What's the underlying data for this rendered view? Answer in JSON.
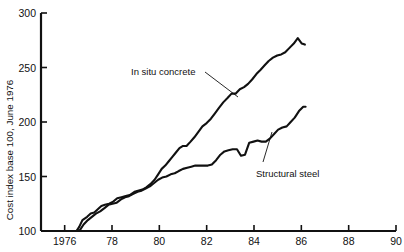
{
  "chart_data": {
    "type": "line",
    "title": "",
    "xlabel": "",
    "ylabel": "Cost index base 100, June 1976",
    "xlim": [
      1975.0,
      1990.0
    ],
    "ylim": [
      100,
      300
    ],
    "grid": false,
    "legend_position": "inline-annotations",
    "x_ticks": [
      1976,
      1978,
      1980,
      1982,
      1984,
      1986,
      1988,
      1990
    ],
    "x_tick_labels": [
      "1976",
      "78",
      "80",
      "82",
      "84",
      "86",
      "88",
      "90"
    ],
    "y_ticks": [
      100,
      150,
      200,
      250,
      300
    ],
    "y_tick_labels": [
      "100",
      "150",
      "200",
      "250",
      "300"
    ],
    "annotations": [
      {
        "text": "In situ concrete",
        "series": "In situ concrete"
      },
      {
        "text": "Structural steel",
        "series": "Structural steel"
      }
    ],
    "series": [
      {
        "name": "In situ concrete",
        "color": "#111111",
        "x": [
          1976.5,
          1976.62,
          1976.75,
          1976.95,
          1977.1,
          1977.25,
          1977.4,
          1977.55,
          1977.7,
          1977.88,
          1978.05,
          1978.22,
          1978.4,
          1978.58,
          1978.75,
          1978.95,
          1979.1,
          1979.28,
          1979.45,
          1979.62,
          1979.8,
          1979.95,
          1980.1,
          1980.25,
          1980.4,
          1980.55,
          1980.7,
          1980.85,
          1981.0,
          1981.15,
          1981.32,
          1981.48,
          1981.65,
          1981.82,
          1982.0,
          1982.18,
          1982.35,
          1982.52,
          1982.7,
          1982.88,
          1983.05,
          1983.22,
          1983.4,
          1983.58,
          1983.75,
          1983.92,
          1984.1,
          1984.28,
          1984.45,
          1984.62,
          1984.8,
          1984.98,
          1985.15,
          1985.32,
          1985.5,
          1985.68,
          1985.85,
          1986.02,
          1986.15
        ],
        "y": [
          100,
          104,
          110,
          113,
          116,
          117,
          120,
          123,
          124,
          125,
          127,
          130,
          131,
          132,
          133,
          136,
          137,
          138,
          140,
          143,
          147,
          152,
          157,
          160,
          164,
          168,
          172,
          176,
          178,
          178,
          182,
          186,
          191,
          196,
          199,
          203,
          208,
          213,
          218,
          222,
          226,
          226,
          230,
          232,
          235,
          239,
          244,
          248,
          252,
          256,
          259,
          261,
          262,
          264,
          268,
          272,
          277,
          272,
          271
        ]
      },
      {
        "name": "Structural steel",
        "color": "#111111",
        "x": [
          1976.5,
          1976.65,
          1976.8,
          1976.98,
          1977.15,
          1977.32,
          1977.5,
          1977.68,
          1977.85,
          1978.02,
          1978.2,
          1978.38,
          1978.55,
          1978.72,
          1978.9,
          1979.08,
          1979.25,
          1979.42,
          1979.6,
          1979.78,
          1979.95,
          1980.12,
          1980.3,
          1980.48,
          1980.65,
          1980.82,
          1981.0,
          1981.18,
          1981.35,
          1981.52,
          1981.7,
          1981.88,
          1982.05,
          1982.22,
          1982.4,
          1982.58,
          1982.75,
          1982.92,
          1983.1,
          1983.28,
          1983.45,
          1983.62,
          1983.8,
          1983.98,
          1984.15,
          1984.32,
          1984.5,
          1984.68,
          1984.85,
          1985.02,
          1985.2,
          1985.38,
          1985.55,
          1985.72,
          1985.9,
          1986.08,
          1986.18
        ],
        "y": [
          100,
          101,
          106,
          110,
          113,
          116,
          118,
          121,
          124,
          125,
          126,
          129,
          131,
          132,
          134,
          136,
          137,
          139,
          141,
          144,
          147,
          149,
          150,
          152,
          153,
          155,
          157,
          158,
          159,
          160,
          160,
          160,
          160,
          161,
          165,
          170,
          173,
          174,
          175,
          175,
          169,
          170,
          181,
          182,
          183,
          182,
          182,
          185,
          189,
          193,
          195,
          196,
          200,
          204,
          210,
          214,
          214
        ]
      }
    ]
  },
  "caption": {
    "text": ""
  }
}
